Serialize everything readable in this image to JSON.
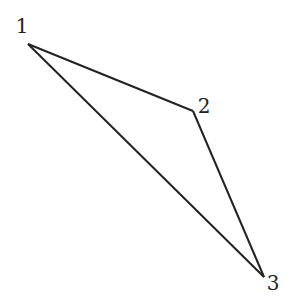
{
  "diagram": {
    "type": "triangle",
    "stroke_color": "#222222",
    "background": "#ffffff",
    "vertices": [
      {
        "id": "1",
        "label": "1",
        "x": 28,
        "y": 44,
        "label_x": 22,
        "label_y": 33
      },
      {
        "id": "2",
        "label": "2",
        "x": 193,
        "y": 111,
        "label_x": 204,
        "label_y": 113
      },
      {
        "id": "3",
        "label": "3",
        "x": 264,
        "y": 277,
        "label_x": 273,
        "label_y": 290
      }
    ],
    "edges": [
      {
        "from": "1",
        "to": "2"
      },
      {
        "from": "2",
        "to": "3"
      },
      {
        "from": "3",
        "to": "1"
      }
    ]
  }
}
